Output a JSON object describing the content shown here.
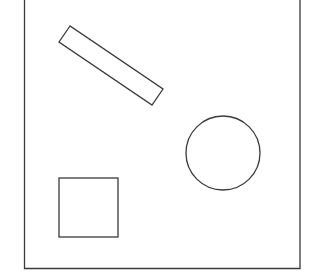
{
  "diagram": {
    "background": "#ffffff",
    "stroke_color": "#3a3a3a",
    "stroke_width": 1.3,
    "frame": {
      "x1": 24.5,
      "y1": -5,
      "x2": 300,
      "y2": 268.5
    },
    "shapes": [
      {
        "type": "rotated-rectangle",
        "label": "",
        "points": [
          [
            70,
            26
          ],
          [
            59,
            42
          ],
          [
            152,
            105
          ],
          [
            163,
            89
          ]
        ]
      },
      {
        "type": "circle",
        "label": "",
        "cx": 223,
        "cy": 153,
        "r": 37
      },
      {
        "type": "square",
        "label": "",
        "x": 59,
        "y": 178,
        "width": 59,
        "height": 59
      }
    ]
  }
}
